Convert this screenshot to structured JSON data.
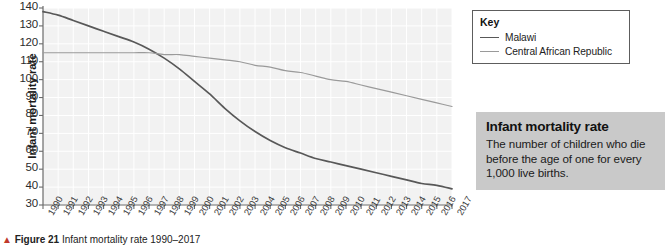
{
  "chart_data": {
    "type": "line",
    "title": "",
    "xlabel": "",
    "ylabel": "Infant mortality rate",
    "ylim": [
      30,
      140
    ],
    "ytick_labels": [
      "140",
      "130",
      "120",
      "110",
      "100",
      "90",
      "80",
      "70",
      "60",
      "50",
      "40",
      "30"
    ],
    "yticks": [
      140,
      130,
      120,
      110,
      100,
      90,
      80,
      70,
      60,
      50,
      40,
      30
    ],
    "grid": true,
    "legend_position": "outside-top-right",
    "x": [
      1990,
      1991,
      1992,
      1993,
      1994,
      1995,
      1996,
      1997,
      1998,
      1999,
      2000,
      2001,
      2002,
      2003,
      2004,
      2005,
      2006,
      2007,
      2008,
      2009,
      2010,
      2011,
      2012,
      2013,
      2014,
      2015,
      2016,
      2017
    ],
    "xtick_labels": [
      "1990",
      "1991",
      "1992",
      "1993",
      "1994",
      "1995",
      "1996",
      "1997",
      "1998",
      "1999",
      "2000",
      "2001",
      "2002",
      "2003",
      "2004",
      "2005",
      "2006",
      "2007",
      "2008",
      "2009",
      "2010",
      "2011",
      "2012",
      "2013",
      "2014",
      "2015",
      "2016",
      "2017"
    ],
    "series": [
      {
        "name": "Malawi",
        "color": "#585858",
        "values": [
          138,
          136,
          133,
          130,
          127,
          124,
          121,
          117,
          112,
          106,
          99,
          92,
          84,
          77,
          71,
          66,
          62,
          59,
          56,
          54,
          52,
          50,
          48,
          46,
          44,
          42,
          41,
          39
        ]
      },
      {
        "name": "Central African Republic",
        "color": "#9a9a9a",
        "values": [
          115,
          115,
          115,
          115,
          115,
          115,
          115,
          115,
          114,
          114,
          113,
          112,
          111,
          110,
          108,
          107,
          105,
          104,
          102,
          100,
          99,
          97,
          95,
          93,
          91,
          89,
          87,
          85
        ]
      }
    ]
  },
  "y_axis": {
    "title": "Infant mortality rate"
  },
  "legend": {
    "title": "Key",
    "items": [
      {
        "label": "Malawi",
        "color": "#585858"
      },
      {
        "label": "Central African Republic",
        "color": "#9a9a9a"
      }
    ]
  },
  "info_box": {
    "title": "Infant mortality rate",
    "text": "The number of children who die before the age of one for every 1,000 live births.",
    "background": "#c9c9c9"
  },
  "caption": {
    "marker": "▲",
    "label": "Figure 21",
    "text": "Infant mortality rate 1990–2017"
  }
}
